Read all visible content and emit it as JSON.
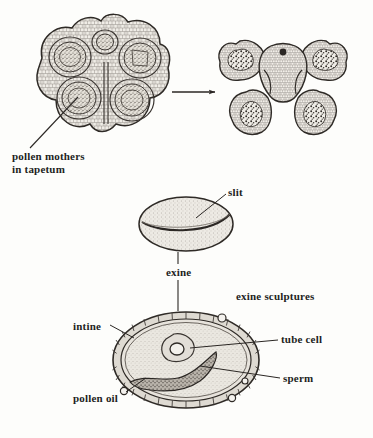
{
  "figure": {
    "medium": "ink line drawing",
    "colors": {
      "background": "#fdfdfb",
      "ink": "#231f1d",
      "tissue_fill": "#efece6",
      "cytoplasm_fill": "#e9e6df",
      "pollen_mass": "#4a4540",
      "wall_fill": "#dedad2"
    }
  },
  "labels": {
    "pollen_mothers": "pollen mothers\nin tapetum",
    "slit": "slit",
    "exine": "exine",
    "exine_sculptures": "exine sculptures",
    "intine": "intine",
    "tube_cell": "tube cell",
    "sperm": "sperm",
    "pollen_oil": "pollen oil"
  },
  "panels": [
    {
      "name": "young-anther-cross-section",
      "description": "Young anther in cross section with four large pollen sacs containing pollen mother cells in tapetum, plus a small central strand",
      "position": {
        "cx": 103,
        "cy": 78
      },
      "locule_count": 4
    },
    {
      "name": "mature-anther-cross-section",
      "description": "Mature dehisced anther in cross section, lobes open, dark clumps of shed pollen inside",
      "position": {
        "cx": 283,
        "cy": 78
      },
      "locule_count": 4
    },
    {
      "name": "pollen-grain-exterior",
      "description": "Whole pollen grain seen from outside showing the germination slit (furrow) across the stippled exine",
      "position": {
        "cx": 186,
        "cy": 224
      }
    },
    {
      "name": "pollen-grain-section",
      "description": "Pollen grain in section showing exine with sculptures, intine, cytoplasm, tube cell nucleus, sperm cell and pollen oil droplets",
      "position": {
        "cx": 186,
        "cy": 360
      }
    }
  ],
  "connectors": [
    {
      "name": "arrow-young-to-mature",
      "kind": "arrow",
      "direction": "right"
    },
    {
      "name": "leader-pollen-mothers",
      "kind": "leader"
    },
    {
      "name": "leader-slit",
      "kind": "leader"
    },
    {
      "name": "leader-exine-upper",
      "kind": "leader"
    },
    {
      "name": "leader-exine-lower",
      "kind": "leader"
    },
    {
      "name": "leader-intine",
      "kind": "leader"
    },
    {
      "name": "leader-tube-cell",
      "kind": "leader"
    },
    {
      "name": "leader-sperm",
      "kind": "leader"
    },
    {
      "name": "leader-pollen-oil",
      "kind": "leader"
    }
  ]
}
